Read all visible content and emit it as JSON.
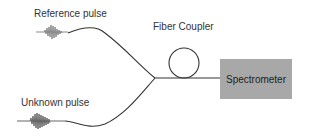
{
  "labels": {
    "reference_pulse": "Reference pulse",
    "unknown_pulse": "Unknown pulse",
    "fiber_coupler": "Fiber Coupler",
    "spectrometer": "Spectrometer"
  },
  "colors": {
    "fiber_line": "#333333",
    "pulse": "#888888",
    "spectrometer_box": "#a8a8a8",
    "background": "#ffffff"
  }
}
